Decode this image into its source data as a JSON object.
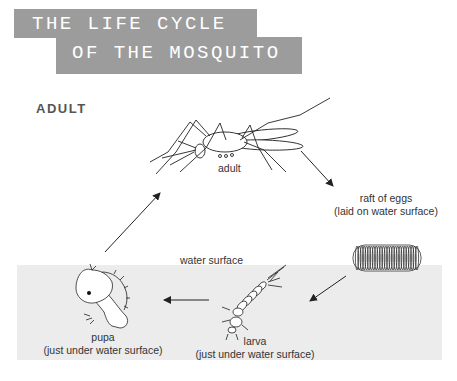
{
  "title": {
    "line1": "THE LIFE CYCLE",
    "line2": "OF THE MOSQUITO"
  },
  "stage_heading": "ADULT",
  "colors": {
    "banner": "#9c9c9c",
    "banner_text": "#ffffff",
    "water": "#ececec",
    "line": "#222222",
    "label": "#333333"
  },
  "diagram": {
    "stages": [
      {
        "id": "adult",
        "label": "adult",
        "note": ""
      },
      {
        "id": "eggs",
        "label": "raft of eggs",
        "note": "(laid on water surface)"
      },
      {
        "id": "larva",
        "label": "larva",
        "note": "(just under water surface)"
      },
      {
        "id": "pupa",
        "label": "pupa",
        "note": "(just under water surface)"
      }
    ],
    "water_label": "water surface",
    "flow": [
      "adult",
      "eggs",
      "larva",
      "pupa",
      "adult"
    ]
  }
}
